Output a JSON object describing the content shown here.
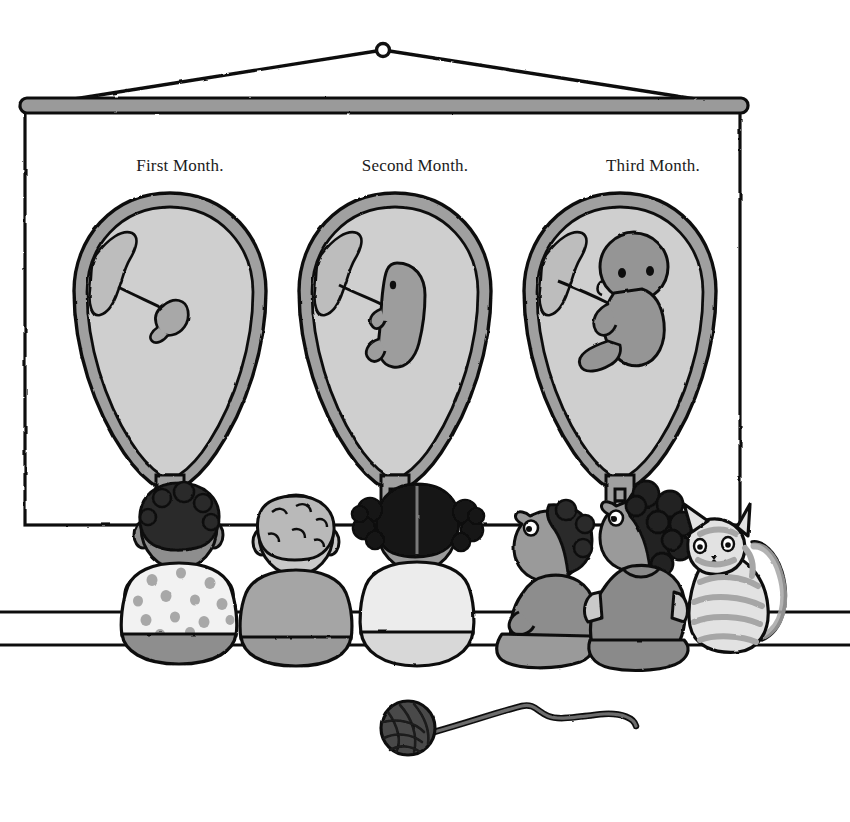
{
  "scene": {
    "title": "Fetal Development Wall Chart With Children Watching",
    "background_color": "#ffffff"
  },
  "chart": {
    "name": "pull-down-wall-chart",
    "panel": {
      "x": 25,
      "y": 105,
      "width": 715,
      "height": 420,
      "fill": "#ffffff",
      "stroke": "#111111"
    },
    "rod": {
      "x": 20,
      "y": 98,
      "width": 728,
      "height": 14,
      "fill": "#9a9a9a",
      "stroke": "#111111"
    },
    "hanger": {
      "ring_cx": 383,
      "ring_cy": 50,
      "ring_r": 6,
      "cord_color": "#111111"
    },
    "labels": [
      {
        "id": "first",
        "text": "First Month."
      },
      {
        "id": "second",
        "text": "Second Month."
      },
      {
        "id": "third",
        "text": "Third Month."
      }
    ],
    "diagrams": [
      {
        "id": "uterus-month-1",
        "label": "First Month.",
        "center_x": 170,
        "wall_color": "#a0a0a0",
        "cavity_color": "#cfcfcf",
        "embryo_color": "#a8a8a8",
        "embryo_size": "tiny",
        "embryo_description": "comma shaped embryo with short umbilical cord"
      },
      {
        "id": "uterus-month-2",
        "label": "Second Month.",
        "center_x": 395,
        "wall_color": "#a0a0a0",
        "cavity_color": "#cfcfcf",
        "embryo_color": "#9d9d9d",
        "embryo_size": "small",
        "embryo_description": "curled fetus with head and limb buds"
      },
      {
        "id": "uterus-month-3",
        "label": "Third Month.",
        "center_x": 620,
        "wall_color": "#a0a0a0",
        "cavity_color": "#cfcfcf",
        "embryo_color": "#959595",
        "embryo_size": "large",
        "embryo_description": "fetus with large head, visible eye, arm and leg"
      }
    ]
  },
  "room": {
    "wall_line_upper_y": 612,
    "wall_line_lower_y": 645,
    "line_color": "#111111"
  },
  "children": [
    {
      "id": "child-1",
      "hair": "dark-curly",
      "hair_color": "#2a2a2a",
      "skin_color": "#8e8e8e",
      "shirt_color": "#f2f2f2",
      "shirt_pattern": "polka-dots",
      "pants_color": "#8e8e8e",
      "pose": "back-view"
    },
    {
      "id": "child-2",
      "hair": "light-curly",
      "hair_color": "#b9b9b9",
      "skin_color": "#c8c8c8",
      "shirt_color": "#a5a5a5",
      "shirt_pattern": "plain",
      "pants_color": "#9a9a9a",
      "pose": "back-view"
    },
    {
      "id": "child-3",
      "hair": "black-pigtails",
      "hair_color": "#151515",
      "skin_color": "#9b9b9b",
      "shirt_color": "#ececec",
      "shirt_pattern": "plain",
      "pants_color": "#d8d8d8",
      "pose": "back-view"
    },
    {
      "id": "child-4",
      "hair": "dark-short",
      "hair_color": "#2a2a2a",
      "skin_color": "#9a9a9a",
      "shirt_color": "#8d8d8d",
      "shirt_pattern": "plain",
      "pants_color": "#9a9a9a",
      "pose": "profile-left-looking-up"
    },
    {
      "id": "child-5",
      "hair": "dark-afro",
      "hair_color": "#232323",
      "skin_color": "#9a9a9a",
      "shirt_color": "#8a8a8a",
      "shirt_pattern": "plain",
      "pants_color": "#8a8a8a",
      "pose": "profile-left-looking-up"
    }
  ],
  "cat": {
    "id": "tabby-cat",
    "body_color": "#e2e2e2",
    "stripe_color": "#a6a6a6",
    "outline_color": "#111111",
    "pose": "sitting-facing-left",
    "description": "striped tabby cat with curled tail"
  },
  "yarn": {
    "id": "yarn-ball",
    "ball_color": "#4a4a4a",
    "string_color": "#6d6d6d",
    "outline_color": "#111111",
    "ball_cx": 408,
    "ball_cy": 728,
    "ball_r": 27,
    "description": "ball of yarn with trailing string to the right"
  },
  "palette": {
    "ink": "#111111",
    "mid_gray": "#9a9a9a",
    "light_gray": "#cfcfcf",
    "pale": "#ececec",
    "dark": "#2a2a2a"
  }
}
